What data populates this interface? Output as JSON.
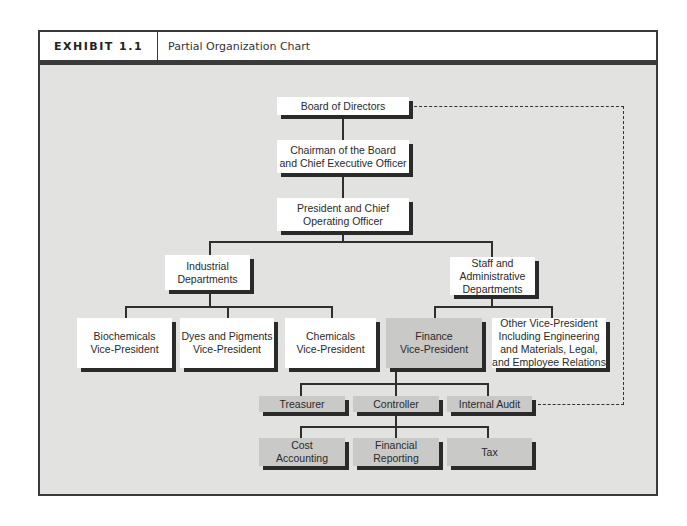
{
  "exhibit": {
    "label": "EXHIBIT 1.1",
    "title": "Partial Organization Chart"
  },
  "chart": {
    "board": "Board of Directors",
    "ceo": "Chairman of the Board\nand Chief Executive Officer",
    "coo": "President and Chief\nOperating Officer",
    "industrial": "Industrial\nDepartments",
    "staff": "Staff and\nAdministrative\nDepartments",
    "biochemicals": "Biochemicals\nVice-President",
    "dyes": "Dyes and Pigments\nVice-President",
    "chemicals": "Chemicals\nVice-President",
    "finance": "Finance\nVice-President",
    "other_vp": "Other Vice-President\nIncluding Engineering\nand Materials, Legal,\nand Employee Relations",
    "treasurer": "Treasurer",
    "controller": "Controller",
    "internal_audit": "Internal Audit",
    "cost_accounting": "Cost\nAccounting",
    "financial_reporting": "Financial\nReporting",
    "tax": "Tax"
  },
  "colors": {
    "background": "#e2e2e0",
    "box_white": "#ffffff",
    "box_gray": "#c9c9c7",
    "shadow": "#2a2a2a"
  }
}
